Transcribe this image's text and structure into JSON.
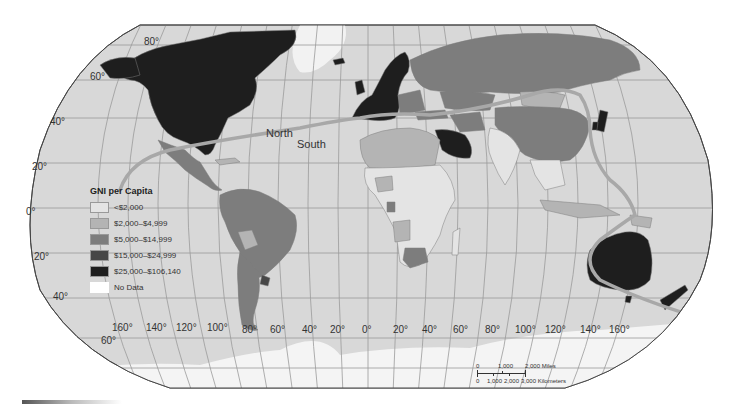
{
  "map": {
    "title": "GNI per Capita",
    "projection": "Robinson",
    "colors": {
      "ocean": "#d8d8d8",
      "no_data": "#ffffff",
      "border": "#7e7e7e",
      "north_south_line": "#a8a8a8"
    },
    "divide_labels": {
      "north": "North",
      "south": "South"
    },
    "latitude_labels": [
      "80°",
      "60°",
      "40°",
      "20°",
      "0°",
      "20°",
      "40°",
      "60°"
    ],
    "longitude_labels": [
      "160°",
      "140°",
      "120°",
      "100°",
      "80°",
      "60°",
      "40°",
      "20°",
      "0°",
      "20°",
      "40°",
      "60°",
      "80°",
      "100°",
      "120°",
      "140°",
      "160°"
    ]
  },
  "legend": {
    "title": "GNI per Capita",
    "items": [
      {
        "label": "<$2,000",
        "color": "#e4e4e4"
      },
      {
        "label": "$2,000–$4,999",
        "color": "#b4b4b4"
      },
      {
        "label": "$5,000–$14,999",
        "color": "#7d7d7d"
      },
      {
        "label": "$15,000–$24,999",
        "color": "#474747"
      },
      {
        "label": "$25,000–$106,140",
        "color": "#1e1e1e"
      },
      {
        "label": "No Data",
        "color": "#ffffff"
      }
    ]
  },
  "scale_bar": {
    "miles": [
      "0",
      "1,000",
      "2,000 Miles"
    ],
    "kilometers": [
      "0",
      "1,000",
      "2,000",
      "3,000 Kilometers"
    ]
  }
}
